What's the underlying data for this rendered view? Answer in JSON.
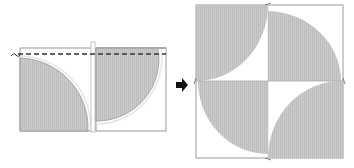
{
  "diagram": {
    "colors": {
      "fabric_gray": "#c8c8c8",
      "fabric_stripe": "#bdbdbd",
      "outline": "#9a9a9a",
      "seam_line": "#333333",
      "arrow": "#111111",
      "background": "#ffffff"
    },
    "left_panel": {
      "label": "two units sewn with seam line",
      "units": 2,
      "seam": "dashed"
    },
    "arrow": {
      "icon": "right-arrow-icon"
    },
    "right_panel": {
      "label": "four-unit assembled block",
      "units": 4
    }
  }
}
